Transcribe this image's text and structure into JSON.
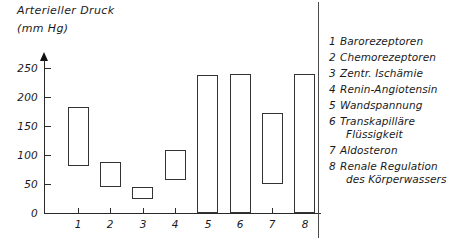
{
  "chart_data": {
    "type": "bar",
    "title": "Arterieller Druck (mm Hg)",
    "title_lines": [
      "Arterieller Druck",
      "(mm Hg)"
    ],
    "xlabel": "",
    "ylabel": "Arterieller Druck (mm Hg)",
    "ylim": [
      0,
      265
    ],
    "yticks": [
      0,
      50,
      100,
      150,
      200,
      250
    ],
    "ytick_labels": [
      "0",
      "50",
      "100",
      "150",
      "200",
      "250"
    ],
    "categories": [
      "1",
      "2",
      "3",
      "4",
      "5",
      "6",
      "7",
      "8"
    ],
    "grid": false,
    "legend_position": "right",
    "bar_style": "floating-range-hollow",
    "bars": [
      {
        "category": "1",
        "low": 80,
        "high": 182,
        "label": "Barorezeptoren"
      },
      {
        "category": "2",
        "low": 45,
        "high": 88,
        "label": "Chemorezeptoren"
      },
      {
        "category": "3",
        "low": 25,
        "high": 45,
        "label": "Zentr. Ischämie"
      },
      {
        "category": "4",
        "low": 57,
        "high": 108,
        "label": "Renin-Angiotensin"
      },
      {
        "category": "5",
        "low": 0,
        "high": 238,
        "label": "Wandspannung"
      },
      {
        "category": "6",
        "low": 0,
        "high": 240,
        "label": "Transkapilläre Flüssigkeit"
      },
      {
        "category": "7",
        "low": 50,
        "high": 173,
        "label": "Aldosteron"
      },
      {
        "category": "8",
        "low": 0,
        "high": 240,
        "label": "Renale Regulation des Körperwassers"
      }
    ],
    "legend_entries": [
      {
        "num": "1",
        "line1": "Barorezeptoren",
        "line2": ""
      },
      {
        "num": "2",
        "line1": "Chemorezeptoren",
        "line2": ""
      },
      {
        "num": "3",
        "line1": "Zentr. Ischämie",
        "line2": ""
      },
      {
        "num": "4",
        "line1": "Renin-Angiotensin",
        "line2": ""
      },
      {
        "num": "5",
        "line1": "Wandspannung",
        "line2": ""
      },
      {
        "num": "6",
        "line1": "Transkapilläre",
        "line2": "Flüssigkeit"
      },
      {
        "num": "7",
        "line1": "Aldosteron",
        "line2": ""
      },
      {
        "num": "8",
        "line1": "Renale Regulation",
        "line2": "des Körperwassers"
      }
    ],
    "colors": {
      "axis": "#2a2a2a",
      "bar_outline": "#333333",
      "bar_fill": "#ffffff",
      "text": "#1a1a1a",
      "background": "#ffffff"
    }
  }
}
